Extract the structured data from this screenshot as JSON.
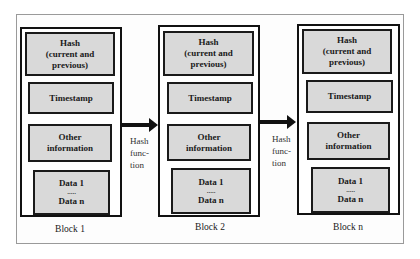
{
  "diagram": {
    "type": "blockchain-structure",
    "blocks": [
      {
        "label": "Block 1",
        "fields": {
          "hash": [
            "Hash",
            "(current and",
            "previous)"
          ],
          "timestamp": "Timestamp",
          "other": [
            "Other",
            "information"
          ],
          "data": [
            "Data 1",
            ".....",
            "Data n"
          ]
        }
      },
      {
        "label": "Block 2",
        "fields": {
          "hash": [
            "Hash",
            "(current and",
            "previous)"
          ],
          "timestamp": "Timestamp",
          "other": [
            "Other",
            "information"
          ],
          "data": [
            "Data 1",
            ".....",
            "Data n"
          ]
        }
      },
      {
        "label": "Block n",
        "fields": {
          "hash": [
            "Hash",
            "(current and",
            "previous)"
          ],
          "timestamp": "Timestamp",
          "other": [
            "Other",
            "information"
          ],
          "data": [
            "Data 1",
            ".....",
            "Data n"
          ]
        }
      }
    ],
    "connectors": [
      {
        "from": "Block 1",
        "to": "Block 2",
        "label": [
          "Hash",
          "func-",
          "tion"
        ]
      },
      {
        "from": "Block 2",
        "to": "Block n",
        "label": [
          "Hash",
          "func-",
          "tion"
        ]
      }
    ],
    "colors": {
      "field_fill": "#d9d9d9",
      "border": "#111111",
      "frame_border": "#9a9a9a"
    }
  }
}
